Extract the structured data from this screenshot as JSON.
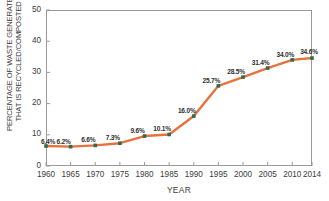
{
  "chart_data": {
    "type": "line",
    "title": "",
    "xlabel": "YEAR",
    "ylabel": "PERCENTAGE OF WASTE GENERATED\nTHAT IS RECYCLED/COMPOSTED",
    "x": [
      1960,
      1965,
      1970,
      1975,
      1980,
      1985,
      1990,
      1995,
      2000,
      2005,
      2010,
      2014
    ],
    "values": [
      6.4,
      6.2,
      6.6,
      7.3,
      9.6,
      10.1,
      16.0,
      25.7,
      28.5,
      31.4,
      34.0,
      34.6
    ],
    "point_labels": [
      "6.4%",
      "6.2%",
      "6.6%",
      "7.3%",
      "9.6%",
      "10.1%",
      "16.0%",
      "25.7%",
      "28.5%",
      "31.4%",
      "34.0%",
      "34.6%"
    ],
    "xtick_labels": [
      "1960",
      "1965",
      "1970",
      "1975",
      "1980",
      "1985",
      "1990",
      "1995",
      "2000",
      "2005",
      "2010",
      "2014"
    ],
    "ytick_labels": [
      "0",
      "10",
      "20",
      "30",
      "40",
      "50"
    ],
    "ytick_values": [
      0,
      10,
      20,
      30,
      40,
      50
    ],
    "xlim": [
      1960,
      2014
    ],
    "ylim": [
      0,
      50
    ],
    "grid": false,
    "legend": false,
    "line_color": "#E8713C",
    "marker_color": "#2E6B52",
    "axis_color": "#9A9A9A",
    "text_color": "#3C3C3C"
  }
}
